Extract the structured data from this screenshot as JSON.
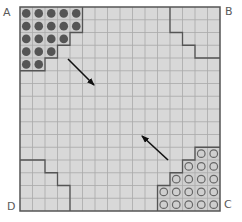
{
  "diagram": {
    "type": "grid-board",
    "rows": 16,
    "cols": 16,
    "colors": {
      "board_fill": "#d8d8d8",
      "grid_line": "#aaaaaa",
      "border": "#555555",
      "region_outline": "#555555",
      "zone_fill": "#cfcfcf",
      "filled_piece": "#555555",
      "hollow_piece_stroke": "#666666",
      "arrow": "#111111",
      "label": "#5a5a5a"
    },
    "corners": {
      "top_left": "A",
      "top_right": "B",
      "bottom_right": "C",
      "bottom_left": "D"
    },
    "filled_pieces": {
      "corner": "A",
      "count": 19,
      "row_counts": [
        5,
        5,
        4,
        3,
        2
      ],
      "cells": [
        [
          0,
          0
        ],
        [
          0,
          1
        ],
        [
          0,
          2
        ],
        [
          0,
          3
        ],
        [
          0,
          4
        ],
        [
          1,
          0
        ],
        [
          1,
          1
        ],
        [
          1,
          2
        ],
        [
          1,
          3
        ],
        [
          1,
          4
        ],
        [
          2,
          0
        ],
        [
          2,
          1
        ],
        [
          2,
          2
        ],
        [
          2,
          3
        ],
        [
          3,
          0
        ],
        [
          3,
          1
        ],
        [
          3,
          2
        ],
        [
          4,
          0
        ],
        [
          4,
          1
        ]
      ]
    },
    "hollow_pieces": {
      "corner": "C",
      "count": 19,
      "row_counts": [
        2,
        3,
        4,
        5,
        5
      ],
      "cells": [
        [
          11,
          14
        ],
        [
          11,
          15
        ],
        [
          12,
          13
        ],
        [
          12,
          14
        ],
        [
          12,
          15
        ],
        [
          13,
          12
        ],
        [
          13,
          13
        ],
        [
          13,
          14
        ],
        [
          13,
          15
        ],
        [
          14,
          11
        ],
        [
          14,
          12
        ],
        [
          14,
          13
        ],
        [
          14,
          14
        ],
        [
          14,
          15
        ],
        [
          15,
          11
        ],
        [
          15,
          12
        ],
        [
          15,
          13
        ],
        [
          15,
          14
        ],
        [
          15,
          15
        ]
      ]
    },
    "empty_zones": [
      {
        "corner": "B",
        "outline_grid_points": [
          [
            12,
            0
          ],
          [
            12,
            2
          ],
          [
            13,
            2
          ],
          [
            13,
            3
          ],
          [
            14,
            3
          ],
          [
            14,
            4
          ],
          [
            16,
            4
          ]
        ]
      },
      {
        "corner": "D",
        "outline_grid_points": [
          [
            0,
            12
          ],
          [
            2,
            12
          ],
          [
            2,
            13
          ],
          [
            3,
            13
          ],
          [
            3,
            14
          ],
          [
            4,
            14
          ],
          [
            4,
            16
          ]
        ]
      }
    ],
    "arrows": [
      {
        "name": "arrow-a-to-c",
        "from": [
          68,
          59
        ],
        "to": [
          94,
          85
        ],
        "direction": "toward C"
      },
      {
        "name": "arrow-c-to-a",
        "from": [
          168,
          160
        ],
        "to": [
          142,
          136
        ],
        "direction": "toward A"
      }
    ]
  }
}
